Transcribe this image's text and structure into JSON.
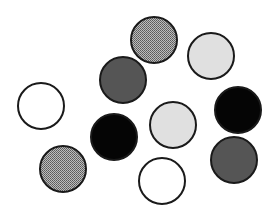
{
  "figure": {
    "width": 273,
    "height": 223,
    "background": "#ffffff",
    "stroke_color": "#1a1a1a",
    "stroke_width": 2,
    "fills": {
      "white": "#ffffff",
      "light-gray": "#e0e0e0",
      "hatched": "#9a9a9a",
      "dark-gray": "#555555",
      "black": "#050505"
    },
    "circles": [
      {
        "id": "hatched-top",
        "cx": 154,
        "cy": 40,
        "r": 23,
        "fill": "hatched"
      },
      {
        "id": "light-gray-top-right",
        "cx": 211,
        "cy": 56,
        "r": 23,
        "fill": "light-gray"
      },
      {
        "id": "dark-gray-upper",
        "cx": 123,
        "cy": 80,
        "r": 23,
        "fill": "dark-gray"
      },
      {
        "id": "white-left",
        "cx": 41,
        "cy": 106,
        "r": 23,
        "fill": "white"
      },
      {
        "id": "black-right",
        "cx": 238,
        "cy": 110,
        "r": 23,
        "fill": "black"
      },
      {
        "id": "light-gray-middle",
        "cx": 173,
        "cy": 125,
        "r": 23,
        "fill": "light-gray"
      },
      {
        "id": "black-middle",
        "cx": 114,
        "cy": 137,
        "r": 23,
        "fill": "black"
      },
      {
        "id": "dark-gray-right",
        "cx": 234,
        "cy": 160,
        "r": 23,
        "fill": "dark-gray"
      },
      {
        "id": "hatched-bottom-left",
        "cx": 63,
        "cy": 169,
        "r": 23,
        "fill": "hatched"
      },
      {
        "id": "white-bottom",
        "cx": 162,
        "cy": 181,
        "r": 23,
        "fill": "white"
      }
    ]
  }
}
